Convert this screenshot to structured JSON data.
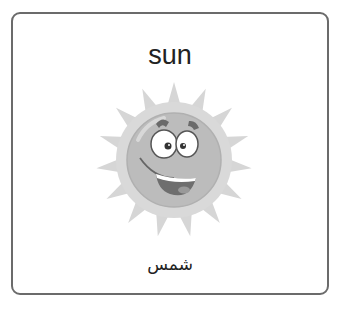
{
  "card": {
    "word_english": "sun",
    "word_arabic": "شمس",
    "illustration": "smiling-sun-icon"
  },
  "colors": {
    "border": "#6b6b6b",
    "text": "#222222",
    "sun_rays": "#d4d4d4",
    "sun_face": "#bdbdbd"
  }
}
